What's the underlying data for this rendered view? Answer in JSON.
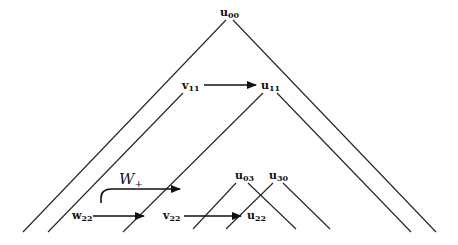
{
  "diagram": {
    "nodes": {
      "u00": {
        "base": "u",
        "sub": "00"
      },
      "v11": {
        "base": "v",
        "sub": "11"
      },
      "u11": {
        "base": "u",
        "sub": "11"
      },
      "u03": {
        "base": "u",
        "sub": "03"
      },
      "u30": {
        "base": "u",
        "sub": "30"
      },
      "w22": {
        "base": "w",
        "sub": "22"
      },
      "v22": {
        "base": "v",
        "sub": "22"
      },
      "u22": {
        "base": "u",
        "sub": "22"
      }
    },
    "curve_label": {
      "base": "W",
      "sub": "+"
    },
    "arrows": [
      {
        "from": "v11",
        "to": "u11"
      },
      {
        "from": "w22",
        "to": "v22"
      },
      {
        "from": "v22",
        "to": "u22"
      }
    ],
    "cones": [
      {
        "apex": "u00",
        "description": "outer light cone"
      },
      {
        "apex": "v11",
        "description": "left edge only"
      },
      {
        "apex": "u11",
        "description": "light cone"
      },
      {
        "apex": "u03",
        "description": "light cone"
      },
      {
        "apex": "u30",
        "description": "light cone"
      }
    ]
  }
}
